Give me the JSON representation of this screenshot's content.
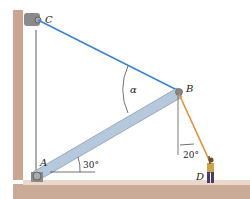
{
  "diagram": {
    "points": {
      "C": {
        "label": "C"
      },
      "B": {
        "label": "B"
      },
      "A": {
        "label": "A"
      },
      "D": {
        "label": "D"
      }
    },
    "angles": {
      "alpha": "α",
      "rod_angle": "30°",
      "rope_angle": "20°"
    },
    "colors": {
      "cable": "#3a7fd0",
      "rope": "#e0903a",
      "rod": "#b6c8dc",
      "wall": "#c9a592",
      "floor": "#b89a86"
    }
  }
}
